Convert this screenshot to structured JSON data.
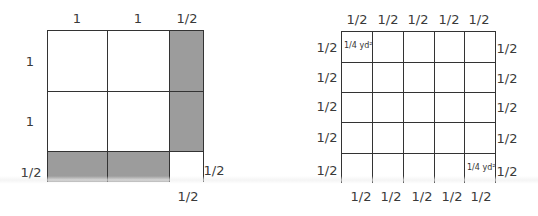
{
  "left_diagram": {
    "top_labels": [
      "1",
      "1",
      "1/2"
    ],
    "left_labels": [
      "1",
      "1",
      "1/2"
    ],
    "corner_right_label": "1/2",
    "corner_bottom_label": "1/2",
    "shaded_color": "#9c9c9c",
    "grid": {
      "columns": [
        1,
        1,
        0.5
      ],
      "rows": [
        1,
        1,
        0.5
      ],
      "shaded_cells": [
        [
          0,
          2
        ],
        [
          1,
          2
        ],
        [
          2,
          0
        ],
        [
          2,
          1
        ]
      ],
      "empty_corner_cell": [
        2,
        2
      ]
    }
  },
  "right_diagram": {
    "top_labels": [
      "1/2",
      "1/2",
      "1/2",
      "1/2",
      "1/2"
    ],
    "bottom_labels": [
      "1/2",
      "1/2",
      "1/2",
      "1/2",
      "1/2"
    ],
    "left_labels": [
      "1/2",
      "1/2",
      "1/2",
      "1/2",
      "1/2"
    ],
    "right_labels": [
      "1/2",
      "1/2",
      "1/2",
      "1/2",
      "1/2"
    ],
    "grid": {
      "columns": 5,
      "rows": 5
    },
    "cell_notes": [
      {
        "row": 0,
        "col": 0,
        "text": "1/4 yd²"
      },
      {
        "row": 4,
        "col": 4,
        "text": "1/4 yd²"
      }
    ]
  }
}
